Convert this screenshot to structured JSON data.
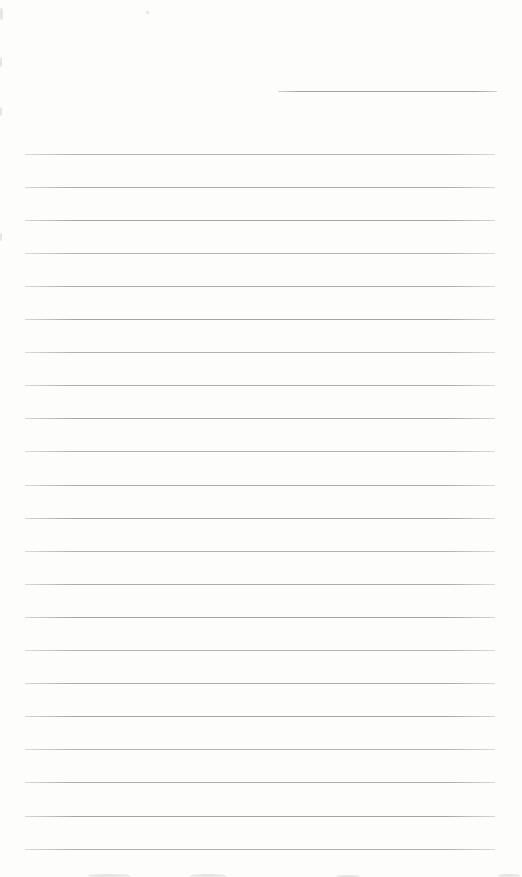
{
  "page": {
    "width": 522,
    "height": 877,
    "background_color": "#fdfdfc",
    "kind": "scanned blank ruled notepad page, no text content"
  },
  "ruling": {
    "line_color": "#a2a19f",
    "line_edge_fade_color": "rgba(162,161,159,0.45)",
    "line_thickness_px": 1,
    "short_top_line": {
      "x_start": 278,
      "x_end": 497,
      "y": 91
    },
    "full_lines": {
      "count": 22,
      "x_start": 25,
      "x_end": 495,
      "y_first": 153.5,
      "y_spacing": 33.1
    }
  },
  "scan_artifacts": {
    "color": "#e6e5e2",
    "specks": [
      {
        "x": 0,
        "y": 8,
        "w": 3,
        "h": 12
      },
      {
        "x": 0,
        "y": 57,
        "w": 2,
        "h": 10
      },
      {
        "x": 0,
        "y": 107,
        "w": 2,
        "h": 9
      },
      {
        "x": 0,
        "y": 233,
        "w": 2,
        "h": 8
      },
      {
        "x": 146,
        "y": 11,
        "w": 3,
        "h": 3
      },
      {
        "x": 88,
        "y": 874,
        "w": 42,
        "h": 3
      },
      {
        "x": 190,
        "y": 874,
        "w": 36,
        "h": 3
      },
      {
        "x": 336,
        "y": 875,
        "w": 24,
        "h": 2
      },
      {
        "x": 498,
        "y": 874,
        "w": 22,
        "h": 3
      }
    ]
  }
}
